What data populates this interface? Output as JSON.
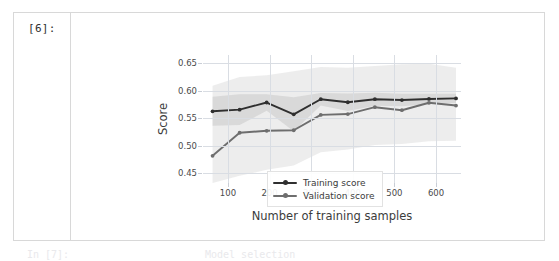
{
  "notebook": {
    "cell": {
      "prompt_label": "[6]:",
      "output_type": "image/figure"
    },
    "below_cell_partial": {
      "left_fragment": "In [7]:",
      "right_fragment": "Model selection"
    }
  },
  "colors": {
    "background": "#ffffff",
    "cell_border": "#d8d8d8",
    "gridline": "#d9dde3",
    "tick_text": "#4a4a4a",
    "axis_label_text": "#3c3c3c",
    "training_line": "#2f2f2f",
    "validation_line": "#6e6e6e",
    "training_band": "#c9c9c9",
    "validation_band": "#d6d6d6",
    "legend_border": "#e2e2e2"
  },
  "chart_data": {
    "type": "line",
    "title": "",
    "xlabel": "Number of training samples",
    "ylabel": "Score",
    "xlim": [
      40,
      660
    ],
    "ylim": [
      0.432,
      0.665
    ],
    "xticks": [
      100,
      200,
      300,
      400,
      500,
      600
    ],
    "yticks": [
      0.45,
      0.5,
      0.55,
      0.6,
      0.65
    ],
    "ytick_labels": [
      "0.45",
      "0.50",
      "0.55",
      "0.60",
      "0.65"
    ],
    "xtick_labels": [
      "100",
      "200",
      "300",
      "400",
      "500",
      "600"
    ],
    "grid": true,
    "legend_position": "lower right",
    "x": [
      63,
      128,
      193,
      258,
      323,
      388,
      453,
      518,
      583,
      648
    ],
    "series": [
      {
        "name": "Training score",
        "color": "#2f2f2f",
        "marker": "circle",
        "values": [
          0.5625,
          0.5655,
          0.5785,
          0.557,
          0.5845,
          0.579,
          0.5845,
          0.583,
          0.585,
          0.586
        ],
        "band_upper": [
          0.589,
          0.5935,
          0.5935,
          0.588,
          0.596,
          0.595,
          0.5965,
          0.5945,
          0.5945,
          0.5945
        ],
        "band_lower": [
          0.536,
          0.5375,
          0.5635,
          0.526,
          0.573,
          0.563,
          0.5725,
          0.5715,
          0.5755,
          0.5775
        ]
      },
      {
        "name": "Validation score",
        "color": "#6e6e6e",
        "marker": "circle",
        "values": [
          0.4815,
          0.5235,
          0.527,
          0.528,
          0.556,
          0.5575,
          0.57,
          0.5645,
          0.578,
          0.573
        ],
        "band_upper": [
          0.609,
          0.625,
          0.628,
          0.6355,
          0.643,
          0.642,
          0.645,
          0.648,
          0.649,
          0.642
        ],
        "band_lower": [
          0.432,
          0.445,
          0.456,
          0.464,
          0.488,
          0.493,
          0.501,
          0.503,
          0.508,
          0.509
        ]
      }
    ],
    "legend": [
      {
        "label": "Training score",
        "color": "#2f2f2f"
      },
      {
        "label": "Validation score",
        "color": "#6e6e6e"
      }
    ]
  }
}
